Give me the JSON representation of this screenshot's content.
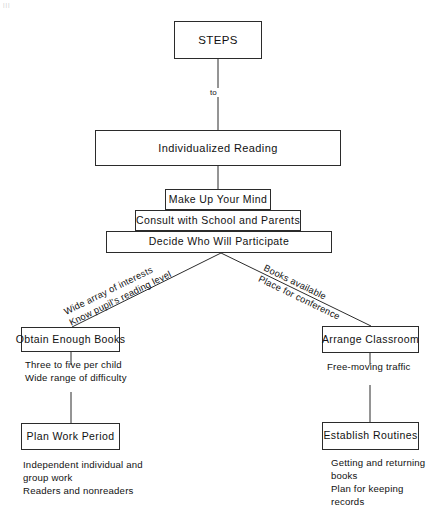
{
  "diagram": {
    "title": "STEPS",
    "type": "flowchart",
    "corner_mark": "|||",
    "nodes": [
      {
        "id": "steps",
        "label": "STEPS"
      },
      {
        "id": "individualized_reading",
        "label": "Individualized Reading"
      },
      {
        "id": "make_up_mind",
        "label": "Make Up Your Mind"
      },
      {
        "id": "consult",
        "label": "Consult with School and Parents"
      },
      {
        "id": "decide",
        "label": "Decide Who Will Participate"
      },
      {
        "id": "obtain_books",
        "label": "Obtain Enough Books"
      },
      {
        "id": "arrange_classroom",
        "label": "Arrange Classroom"
      },
      {
        "id": "plan_work_period",
        "label": "Plan Work Period"
      },
      {
        "id": "establish_routines",
        "label": "Establish Routines"
      }
    ],
    "connector_labels": {
      "steps_to_reading": "to"
    },
    "edge_labels": {
      "left_branch": "Wide array of interests\nKnow pupil's reading level",
      "right_branch": "Books available\nPlace for conference"
    },
    "notes": {
      "obtain_books": "Three to five per child\nWide range of difficulty",
      "arrange_classroom": "Free-moving traffic",
      "plan_work_period": "Independent individual and\n    group work\nReaders and nonreaders",
      "establish_routines": "Getting and returning\n    books\nPlan for keeping\n    records"
    },
    "colors": {
      "ink": "#111111",
      "stroke": "#2b2b2b",
      "background": "#ffffff"
    }
  }
}
